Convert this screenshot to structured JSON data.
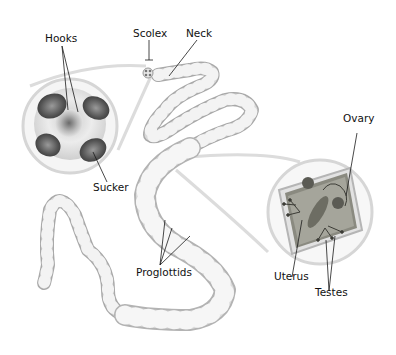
{
  "diagram": {
    "labels": {
      "hooks": "Hooks",
      "scolex": "Scolex",
      "neck": "Neck",
      "sucker": "Sucker",
      "ovary": "Ovary",
      "proglottids": "Proglottids",
      "uterus": "Uterus",
      "testes": "Testes"
    },
    "colors": {
      "body": "#d6d6d6",
      "body_edge": "#a9a9a9",
      "segment_line": "#f2f2f2",
      "magnifier_ring": "#d9d9d9",
      "sucker": "#5a5a5a",
      "proglottid_inner": "#7d7d74",
      "leader_line": "#1a1a1a"
    }
  }
}
